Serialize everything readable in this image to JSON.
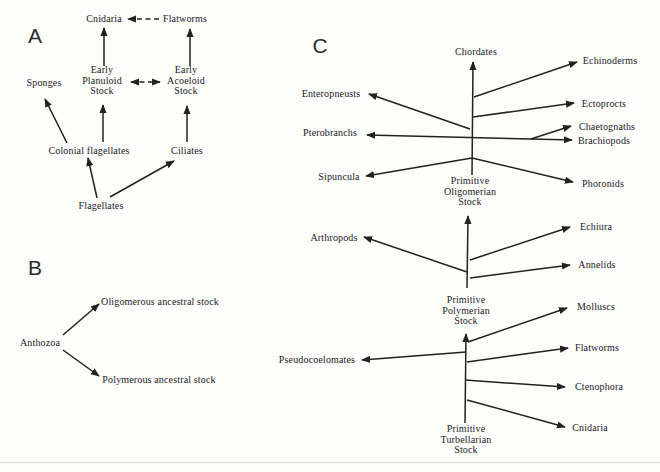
{
  "colors": {
    "ink": "#24211e",
    "paper": "#fdfdfc"
  },
  "panel_a": {
    "letter": "A",
    "nodes": {
      "cnidaria": "Cnidaria",
      "flatworms": "Flatworms",
      "early_planuloid_stock": "Early\nPlanuloid\nStock",
      "early_acoeloid_stock": "Early\nAcoeloid\nStock",
      "sponges": "Sponges",
      "colonial_flagellates": "Colonial flagellates",
      "ciliates": "Ciliates",
      "flagellates": "Flagellates"
    }
  },
  "panel_b": {
    "letter": "B",
    "nodes": {
      "anthozoa": "Anthozoa",
      "oligomerous_stock": "Oligomerous ancestral stock",
      "polymerous_stock": "Polymerous ancestral stock"
    }
  },
  "panel_c": {
    "letter": "C",
    "nodes": {
      "chordates": "Chordates",
      "echinoderms": "Echinoderms",
      "enteropneusts": "Enteropneusts",
      "ectoprocts": "Ectoprocts",
      "pterobranchs": "Pterobranchs",
      "chaetognaths": "Chaetognaths",
      "brachiopods": "Brachiopods",
      "sipuncula": "Sipuncula",
      "phoronids": "Phoronids",
      "primitive_oligomerian_stock": "Primitive\nOligomerian\nStock",
      "arthropods": "Arthropods",
      "echiura": "Echiura",
      "annelids": "Annelids",
      "primitive_polymerian_stock": "Primitive\nPolymerian\nStock",
      "molluscs": "Molluscs",
      "pseudocoelomates": "Pseudocoelomates",
      "flatworms": "Flatworms",
      "ctenophora": "Ctenophora",
      "cnidaria": "Cnidaria",
      "primitive_turbellarian_stock": "Primitive\nTurbellarian\nStock"
    }
  },
  "edges": [
    {
      "name": "flatworms-to-cnidaria",
      "x1": 159,
      "y1": 19,
      "x2": 128,
      "y2": 19,
      "dashed": true
    },
    {
      "name": "planuloid-to-cnidaria",
      "x1": 104,
      "y1": 66,
      "x2": 104,
      "y2": 28
    },
    {
      "name": "acoeloid-to-flatworms",
      "x1": 190,
      "y1": 66,
      "x2": 190,
      "y2": 29
    },
    {
      "name": "planuloid-acoeloid-link",
      "x1": 131,
      "y1": 82,
      "x2": 160,
      "y2": 82,
      "dashed": true,
      "both": true
    },
    {
      "name": "colonial-to-sponges",
      "x1": 67,
      "y1": 143,
      "x2": 45,
      "y2": 99
    },
    {
      "name": "colonial-to-planuloid",
      "x1": 103,
      "y1": 142,
      "x2": 103,
      "y2": 105
    },
    {
      "name": "ciliates-to-acoeloid",
      "x1": 187,
      "y1": 142,
      "x2": 187,
      "y2": 106
    },
    {
      "name": "flagellates-to-colonial",
      "x1": 97,
      "y1": 198,
      "x2": 88,
      "y2": 158
    },
    {
      "name": "flagellates-to-ciliates",
      "x1": 110,
      "y1": 197,
      "x2": 174,
      "y2": 161
    },
    {
      "name": "anthozoa-to-oligomerous",
      "x1": 63,
      "y1": 335,
      "x2": 99,
      "y2": 304
    },
    {
      "name": "anthozoa-to-polymerous",
      "x1": 63,
      "y1": 350,
      "x2": 99,
      "y2": 376
    },
    {
      "name": "oligomerian-trunk",
      "x1": 472,
      "y1": 175,
      "x2": 473,
      "y2": 62
    },
    {
      "name": "branch-echinoderms",
      "x1": 474,
      "y1": 97,
      "x2": 577,
      "y2": 62
    },
    {
      "name": "branch-ectoprocts",
      "x1": 473,
      "y1": 117,
      "x2": 574,
      "y2": 103
    },
    {
      "name": "branch-enteropneusts",
      "x1": 470,
      "y1": 129,
      "x2": 369,
      "y2": 94
    },
    {
      "name": "branch-pterobranchs",
      "x1": 531,
      "y1": 139,
      "x2": 367,
      "y2": 135
    },
    {
      "name": "branch-chaetognaths",
      "x1": 531,
      "y1": 139,
      "x2": 571,
      "y2": 126
    },
    {
      "name": "branch-brachiopods",
      "x1": 531,
      "y1": 139,
      "x2": 572,
      "y2": 140
    },
    {
      "name": "branch-sipuncula",
      "x1": 472,
      "y1": 158,
      "x2": 366,
      "y2": 176
    },
    {
      "name": "branch-phoronids",
      "x1": 472,
      "y1": 158,
      "x2": 573,
      "y2": 182
    },
    {
      "name": "polymerian-trunk",
      "x1": 467,
      "y1": 288,
      "x2": 468,
      "y2": 216
    },
    {
      "name": "branch-echiura",
      "x1": 470,
      "y1": 260,
      "x2": 570,
      "y2": 227
    },
    {
      "name": "branch-arthropods",
      "x1": 467,
      "y1": 272,
      "x2": 364,
      "y2": 237
    },
    {
      "name": "branch-annelids",
      "x1": 470,
      "y1": 278,
      "x2": 570,
      "y2": 265
    },
    {
      "name": "turbellarian-trunk",
      "x1": 465,
      "y1": 423,
      "x2": 466,
      "y2": 334
    },
    {
      "name": "branch-molluscs",
      "x1": 468,
      "y1": 342,
      "x2": 567,
      "y2": 308
    },
    {
      "name": "branch-pseudocoelomates",
      "x1": 466,
      "y1": 352,
      "x2": 362,
      "y2": 360
    },
    {
      "name": "branch-flatworms",
      "x1": 467,
      "y1": 362,
      "x2": 568,
      "y2": 348
    },
    {
      "name": "branch-ctenophora",
      "x1": 465,
      "y1": 380,
      "x2": 565,
      "y2": 387
    },
    {
      "name": "branch-cnidaria",
      "x1": 467,
      "y1": 400,
      "x2": 565,
      "y2": 427
    }
  ]
}
